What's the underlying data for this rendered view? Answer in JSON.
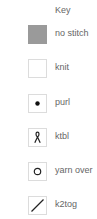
{
  "key": {
    "title": "Key",
    "items": [
      {
        "symbol": "no-stitch-symbol",
        "label": "no stitch",
        "fill": "#9a9a9a"
      },
      {
        "symbol": "knit-symbol",
        "label": "knit"
      },
      {
        "symbol": "purl-dot-symbol",
        "label": "purl"
      },
      {
        "symbol": "ktbl-twisted-symbol",
        "label": "ktbl"
      },
      {
        "symbol": "yarn-over-circle-symbol",
        "label": "yarn over"
      },
      {
        "symbol": "k2tog-slash-symbol",
        "label": "k2tog"
      }
    ]
  }
}
